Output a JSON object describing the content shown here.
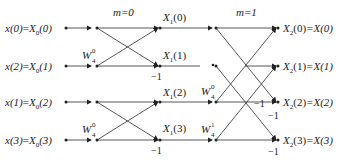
{
  "diagram": {
    "type": "FFT butterfly flow graph (4-point DIT)",
    "stage_labels": [
      "m=0",
      "m=1"
    ],
    "inputs": [
      {
        "lhs": "x(0)",
        "rhs_base": "X",
        "rhs_sub": "0",
        "rhs_arg": "(0)"
      },
      {
        "lhs": "x(2)",
        "rhs_base": "X",
        "rhs_sub": "0",
        "rhs_arg": "(1)"
      },
      {
        "lhs": "x(1)",
        "rhs_base": "X",
        "rhs_sub": "0",
        "rhs_arg": "(2)"
      },
      {
        "lhs": "x(3)",
        "rhs_base": "X",
        "rhs_sub": "0",
        "rhs_arg": "(3)"
      }
    ],
    "stage1_outputs": [
      {
        "base": "X",
        "sub": "1",
        "arg": "(0)"
      },
      {
        "base": "X",
        "sub": "1",
        "arg": "(1)"
      },
      {
        "base": "X",
        "sub": "1",
        "arg": "(2)"
      },
      {
        "base": "X",
        "sub": "1",
        "arg": "(3)"
      }
    ],
    "outputs": [
      {
        "base": "X",
        "sub": "2",
        "arg": "(0)",
        "eq": "=X(0)"
      },
      {
        "base": "X",
        "sub": "2",
        "arg": "(1)",
        "eq": "=X(1)"
      },
      {
        "base": "X",
        "sub": "2",
        "arg": "(2)",
        "eq": "=X(2)"
      },
      {
        "base": "X",
        "sub": "2",
        "arg": "(3)",
        "eq": "=X(3)"
      }
    ],
    "twiddles": {
      "stage1_row1": {
        "base": "W",
        "sup": "0",
        "sub": "4"
      },
      "stage1_row3": {
        "base": "W",
        "sup": "0",
        "sub": "4"
      },
      "stage2_row2": {
        "base": "W",
        "sup": "0",
        "sub": "4"
      },
      "stage2_row3": {
        "base": "W",
        "sup": "1",
        "sub": "4"
      }
    },
    "minus_one": "−1",
    "line_color": "#333333"
  }
}
